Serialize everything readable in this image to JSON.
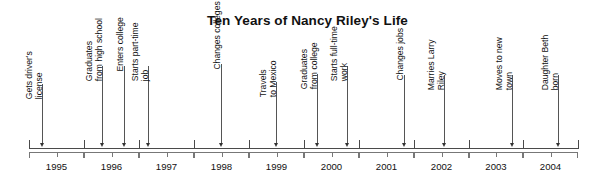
{
  "title": "Ten Years of Nancy Riley's Life",
  "axis": {
    "start_x": 29,
    "end_x": 578,
    "y": 148,
    "start_year": 1995,
    "end_year": 2004
  },
  "years": [
    {
      "label": "1995",
      "start_x": 29,
      "end_x": 84
    },
    {
      "label": "1996",
      "start_x": 84,
      "end_x": 139
    },
    {
      "label": "1997",
      "start_x": 139,
      "end_x": 194
    },
    {
      "label": "1998",
      "start_x": 194,
      "end_x": 249
    },
    {
      "label": "1999",
      "start_x": 249,
      "end_x": 304
    },
    {
      "label": "2000",
      "start_x": 304,
      "end_x": 359
    },
    {
      "label": "2001",
      "start_x": 359,
      "end_x": 414
    },
    {
      "label": "2002",
      "start_x": 414,
      "end_x": 469
    },
    {
      "label": "2003",
      "start_x": 469,
      "end_x": 523
    },
    {
      "label": "2004",
      "start_x": 523,
      "end_x": 578
    }
  ],
  "events": [
    {
      "line1": "Gets driver's",
      "line2": "license",
      "x": 42,
      "label_top": 80
    },
    {
      "line1": "Graduates",
      "line2": "from high school",
      "x": 102,
      "label_top": 62
    },
    {
      "line1": "Enters college",
      "line2": "",
      "x": 124,
      "label_top": 62
    },
    {
      "line1": "Starts part-time",
      "line2": "job",
      "x": 148,
      "label_top": 62
    },
    {
      "line1": "Changes colleges",
      "line2": "",
      "x": 221,
      "label_top": 60
    },
    {
      "line1": "Travels",
      "line2": "to Mexico",
      "x": 276,
      "label_top": 78
    },
    {
      "line1": "Graduates",
      "line2": "from college",
      "x": 317,
      "label_top": 70
    },
    {
      "line1": "Starts full-time",
      "line2": "work",
      "x": 347,
      "label_top": 62
    },
    {
      "line1": "Changes jobs",
      "line2": "",
      "x": 404,
      "label_top": 71
    },
    {
      "line1": "Marries Larry",
      "line2": "Riley",
      "x": 444,
      "label_top": 71
    },
    {
      "line1": "Moves to new",
      "line2": "town",
      "x": 512,
      "label_top": 71
    },
    {
      "line1": "Daughter Beth",
      "line2": "born",
      "x": 558,
      "label_top": 71
    }
  ],
  "colors": {
    "axis": "#4a4a4a",
    "bracket": "#777777",
    "text": "#111111",
    "background": "#ffffff"
  }
}
